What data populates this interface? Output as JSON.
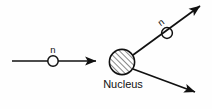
{
  "diagram": {
    "background_color": "#fefefe",
    "stroke_color": "#111111",
    "labels": {
      "incoming_neutron": "n",
      "scattered_neutron": "n",
      "nucleus": "Nucleus"
    },
    "particles": [
      {
        "name": "incoming-neutron",
        "label": "n",
        "shape": "open-circle",
        "cx": 53,
        "cy": 61,
        "r": 5.2,
        "fill": "none",
        "stroke": "#111111"
      },
      {
        "name": "scattered-neutron",
        "label": "n",
        "shape": "open-circle",
        "cx": 167,
        "cy": 33,
        "r": 5.4,
        "fill": "none",
        "stroke": "#111111"
      },
      {
        "name": "nucleus",
        "label": "Nucleus",
        "shape": "hatched-circle",
        "cx": 122,
        "cy": 62,
        "r": 13,
        "fill": "hatch-45",
        "stroke": "#111111"
      }
    ],
    "arrows": [
      {
        "name": "incoming-neutron-arrow",
        "from": [
          12,
          61
        ],
        "to": [
          100,
          61
        ],
        "direction": "right",
        "label": "n"
      },
      {
        "name": "scattered-neutron-arrow",
        "from": [
          133,
          55
        ],
        "to": [
          203,
          4
        ],
        "direction": "up-right",
        "label": "n"
      },
      {
        "name": "recoil-nucleus-arrow",
        "from": [
          133,
          69
        ],
        "to": [
          198,
          94
        ],
        "direction": "down-right",
        "label": ""
      }
    ]
  }
}
